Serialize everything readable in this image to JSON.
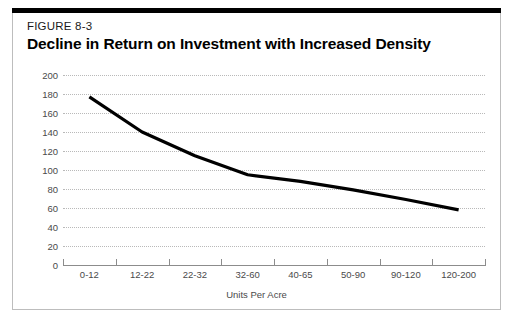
{
  "figure": {
    "number_label": "FIGURE 8-3",
    "title": "Decline in Return on Investment with Increased Density"
  },
  "chart_data": {
    "type": "line",
    "title": "Decline in Return on Investment with Increased Density",
    "subtitle": "FIGURE 8-3",
    "xlabel": "Units Per Acre",
    "ylabel": "Return on Costs (%)",
    "categories": [
      "0-12",
      "12-22",
      "22-32",
      "32-60",
      "40-65",
      "50-90",
      "90-120",
      "120-200"
    ],
    "values": [
      177,
      140,
      115,
      95,
      88,
      79,
      69,
      58
    ],
    "series": [
      {
        "name": "Return on Costs",
        "values": [
          177,
          140,
          115,
          95,
          88,
          79,
          69,
          58
        ],
        "color": "#000000"
      }
    ],
    "ylim": [
      0,
      200
    ],
    "yticks": [
      0,
      20,
      40,
      60,
      80,
      100,
      120,
      140,
      160,
      180,
      200
    ],
    "ytick_labels": [
      "0",
      "20",
      "40",
      "60",
      "80",
      "100",
      "120",
      "140",
      "160",
      "180",
      "200"
    ],
    "grid": true,
    "grid_style": "dotted-horizontal",
    "legend": "none"
  },
  "colors": {
    "line": "#000000",
    "grid": "#b9b9b9",
    "axis": "#8c8c8c",
    "tick_text": "#4a4a4a",
    "frame_border": "#bdbdbd",
    "top_rule": "#000000",
    "background": "#ffffff"
  }
}
